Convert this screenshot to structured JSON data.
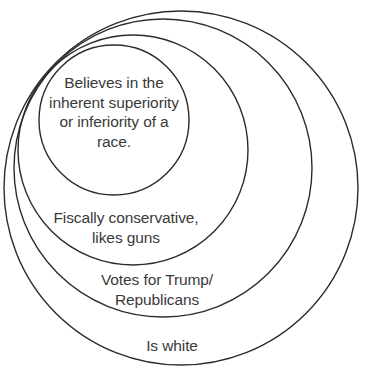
{
  "diagram": {
    "type": "nested-circles",
    "background_color": "#ffffff",
    "stroke_color": "#2b2b2b",
    "text_color": "#3a3a3a",
    "tangent_point": "upper-left",
    "rings": [
      {
        "id": "race",
        "label": "Believes in the\ninherent superiority\nor inferiority of a\nrace.",
        "level": 4,
        "cx": 114,
        "cy": 120,
        "r": 75
      },
      {
        "id": "fiscal",
        "label": "Fiscally conservative,\nlikes guns",
        "level": 3,
        "cx": 133,
        "cy": 150,
        "r": 115
      },
      {
        "id": "trump",
        "label": "Votes for Trump/\nRepublicans",
        "level": 2,
        "cx": 163,
        "cy": 168,
        "r": 149
      },
      {
        "id": "white",
        "label": "Is white",
        "level": 1,
        "cx": 181,
        "cy": 188,
        "r": 177
      }
    ]
  }
}
